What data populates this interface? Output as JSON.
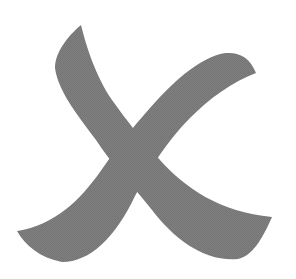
{
  "graphic": {
    "icon": "x-mark-icon",
    "description": "Stylized brush-stroke X mark",
    "fill_color": "#7d7d7d",
    "background_color": "#ffffff"
  }
}
